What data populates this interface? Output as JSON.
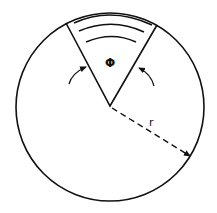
{
  "diagram": {
    "sector_angle_label": "Φ",
    "radius_label": "r",
    "stroke_color": "#111111",
    "background_color": "#ffffff"
  }
}
